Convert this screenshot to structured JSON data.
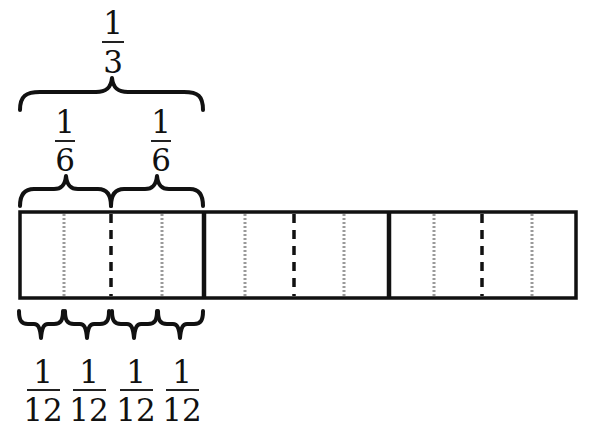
{
  "diagram": {
    "bar": {
      "x": 20,
      "y": 212,
      "width": 556,
      "height": 86,
      "thick_dividers_x": [
        204,
        389
      ],
      "dashed_dividers_x": [
        111,
        296,
        482
      ],
      "dotted_dividers_x": [
        64,
        162,
        245,
        344,
        434,
        532
      ]
    },
    "braces": {
      "third": {
        "x1": 20,
        "x2": 203,
        "y": 110,
        "label": {
          "numerator": "1",
          "denominator": "3",
          "cx": 113
        }
      },
      "sixths": [
        {
          "x1": 20,
          "x2": 111,
          "label": {
            "numerator": "1",
            "denominator": "6",
            "cx": 65
          }
        },
        {
          "x1": 111,
          "x2": 203,
          "label": {
            "numerator": "1",
            "denominator": "6",
            "cx": 160
          }
        }
      ],
      "twelfths": [
        {
          "x1": 19,
          "x2": 63,
          "label": {
            "numerator": "1",
            "denominator": "12",
            "cx": 42
          }
        },
        {
          "x1": 65,
          "x2": 109,
          "label": {
            "numerator": "1",
            "denominator": "12",
            "cx": 89
          }
        },
        {
          "x1": 112,
          "x2": 157,
          "label": {
            "numerator": "1",
            "denominator": "12",
            "cx": 135
          }
        },
        {
          "x1": 158,
          "x2": 203,
          "label": {
            "numerator": "1",
            "denominator": "12",
            "cx": 181
          }
        }
      ]
    },
    "labels": {
      "third": "1/3",
      "sixth": "1/6",
      "twelfth": "1/12"
    },
    "colors": {
      "ink": "#111111",
      "dotted": "#9a9a9a",
      "background": "#ffffff"
    }
  }
}
